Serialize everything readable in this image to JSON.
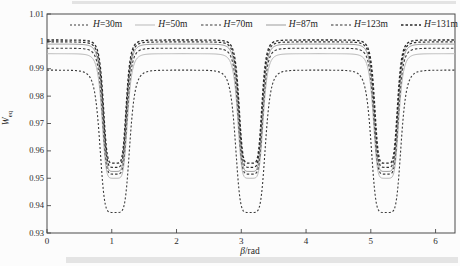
{
  "figure": {
    "axes": {
      "x": {
        "title_var": "β",
        "title_rest": "/rad",
        "tick_labels": [
          "0",
          "1",
          "2",
          "3",
          "4",
          "5",
          "6"
        ]
      },
      "y": {
        "title_var": "W",
        "title_sub": "eq",
        "tick_labels": [
          "1.01",
          "1",
          "0.99",
          "0.98",
          "0.97",
          "0.96",
          "0.95",
          "0.94",
          "0.93"
        ]
      }
    }
  },
  "chart_data": {
    "type": "line",
    "title": "",
    "xlabel": "β/rad",
    "ylabel": "W_eq",
    "xlim": [
      0,
      6.3
    ],
    "ylim": [
      0.93,
      1.01
    ],
    "xticks": [
      0,
      1,
      2,
      3,
      4,
      5,
      6
    ],
    "yticks": [
      1.01,
      1.0,
      0.99,
      0.98,
      0.97,
      0.96,
      0.95,
      0.94,
      0.93
    ],
    "grid": false,
    "legend_position": "inside-top, single row",
    "dip_centers_rad": [
      1.047,
      3.142,
      5.236
    ],
    "curve_model": "W(beta) = plateau - (plateau - min)/(1 + (d/halfwidth)^6), d = |beta - nearest dip center|",
    "series": [
      {
        "name": "H=30m",
        "plateau": 0.9895,
        "min": 0.9375,
        "halfwidth": 0.235,
        "color": "#3a3a3a",
        "dash": "2 2",
        "stroke_width": 1.1
      },
      {
        "name": "H=50m",
        "plateau": 0.9955,
        "min": 0.95,
        "halfwidth": 0.2,
        "color": "#b9b9b9",
        "dash": "",
        "stroke_width": 1.0
      },
      {
        "name": "H=70m",
        "plateau": 0.9975,
        "min": 0.9515,
        "halfwidth": 0.195,
        "color": "#3a3a3a",
        "dash": "2.5 2",
        "stroke_width": 1.1
      },
      {
        "name": "H=87m",
        "plateau": 0.999,
        "min": 0.9525,
        "halfwidth": 0.19,
        "color": "#9c9c9c",
        "dash": "",
        "stroke_width": 1.0
      },
      {
        "name": "H=123m",
        "plateau": 0.9998,
        "min": 0.954,
        "halfwidth": 0.185,
        "color": "#303030",
        "dash": "2.5 2",
        "stroke_width": 1.2
      },
      {
        "name": "H=131m",
        "plateau": 1.0005,
        "min": 0.9555,
        "halfwidth": 0.18,
        "color": "#282828",
        "dash": "2.5 2",
        "stroke_width": 1.3
      }
    ]
  }
}
